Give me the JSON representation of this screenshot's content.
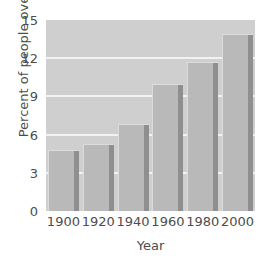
{
  "chart_data": {
    "type": "bar",
    "title": "",
    "xlabel": "Year",
    "ylabel": "Percent of people over 65",
    "categories": [
      "1900",
      "1920",
      "1940",
      "1960",
      "1980",
      "2000"
    ],
    "values": [
      4.8,
      5.3,
      6.8,
      10.0,
      11.7,
      13.9
    ],
    "ylim": [
      0,
      15
    ],
    "yticks": [
      "0",
      "3",
      "6",
      "9",
      "12",
      "15"
    ],
    "ytick_values": [
      0,
      3,
      6,
      9,
      12,
      15
    ],
    "xticks": [
      "1900",
      "1920",
      "1940",
      "1960",
      "1980",
      "2000"
    ],
    "gridlines": [
      3,
      6,
      9,
      12
    ],
    "grid": true,
    "legend": "none",
    "colors": {
      "bar_face": "#b9b9b9",
      "bar_shadow": "#8f8f8f",
      "bar_highlight": "#dcdcdc",
      "plot_background": "#cfcfcf",
      "gridline": "#f2f2f2",
      "figure_background": "#ffffff",
      "text": "#4d4d4d"
    }
  }
}
